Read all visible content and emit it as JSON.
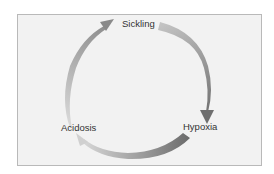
{
  "diagram": {
    "type": "cycle",
    "nodes": [
      {
        "id": "sickling",
        "label": "Sickling"
      },
      {
        "id": "hypoxia",
        "label": "Hypoxia"
      },
      {
        "id": "acidosis",
        "label": "Acidosis"
      }
    ],
    "edges": [
      {
        "from": "sickling",
        "to": "hypoxia"
      },
      {
        "from": "hypoxia",
        "to": "acidosis"
      },
      {
        "from": "acidosis",
        "to": "sickling"
      }
    ],
    "colors": {
      "panel_background": "#f2f2f2",
      "panel_border": "#b9b9b9",
      "arrow_dark": "#7a7a7a",
      "arrow_light": "#cfcfcf",
      "label_text": "#333333"
    }
  }
}
